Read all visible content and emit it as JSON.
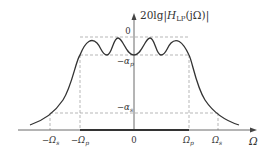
{
  "diagram": {
    "type": "lowpass-chebyshev-magnitude-response",
    "y_axis_label": {
      "prefix": "20lg|",
      "H": "H",
      "sub": "LP",
      "suffix": "(jΩ)|"
    },
    "x_axis_label": "Ω",
    "y_ticks": {
      "zero": "0",
      "alpha_p": "−α",
      "alpha_p_sub": "p",
      "alpha_s": "−α",
      "alpha_s_sub": "s"
    },
    "x_ticks": {
      "neg_omega_s": "−Ω",
      "neg_omega_s_sub": "s",
      "neg_omega_p": "−Ω",
      "neg_omega_p_sub": "p",
      "zero": "0",
      "omega_p": "Ω",
      "omega_p_sub": "p",
      "omega_s": "Ω",
      "omega_s_sub": "s"
    },
    "colors": {
      "curve": "#333333",
      "axis": "#444444",
      "dashed": "#999999",
      "passband_bar": "#333333"
    }
  }
}
